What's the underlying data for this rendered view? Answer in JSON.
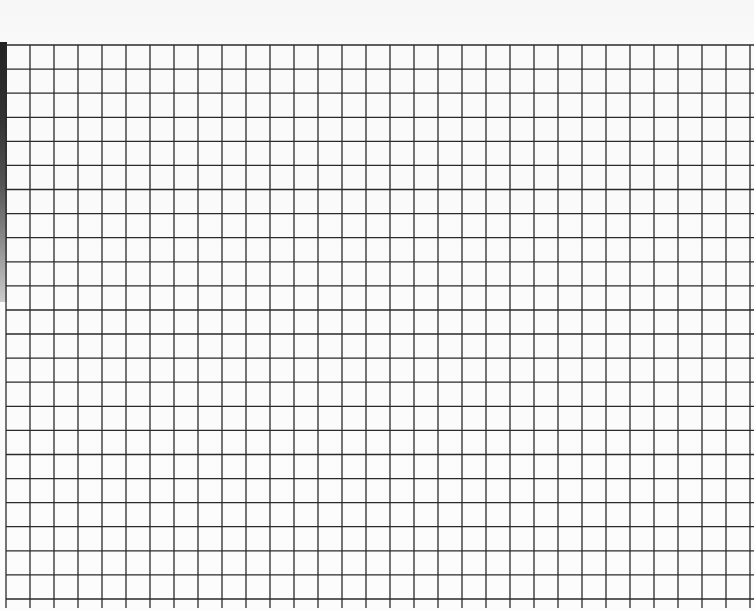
{
  "scene": {
    "subject": "graph paper grid",
    "background_color": "#fbfbfb",
    "line_color": "#2a2a2a",
    "edge_strip_color": "#2b2b2b"
  },
  "grid": {
    "left": 6,
    "top": 45,
    "right": 750,
    "bottom": 599,
    "cell_size": 24.1,
    "columns": 31,
    "rows": 23,
    "line_extend_bottom": 608
  }
}
